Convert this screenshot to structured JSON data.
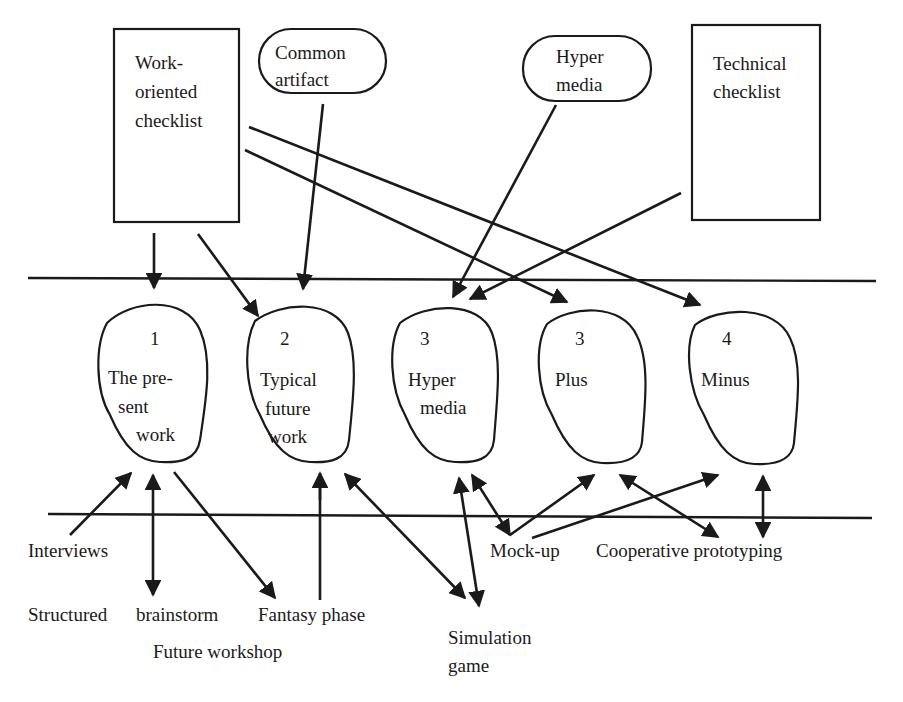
{
  "diagram": {
    "colors": {
      "ink": "#1a1a1a",
      "background": "#ffffff"
    },
    "sources": {
      "work_checklist": {
        "lines": [
          "Work-",
          "oriented",
          "checklist"
        ]
      },
      "common_artifact": {
        "lines": [
          "Common",
          "artifact"
        ]
      },
      "hyper_media": {
        "lines": [
          "Hyper",
          "media"
        ]
      },
      "technical_checklist": {
        "lines": [
          "Technical",
          "checklist"
        ]
      }
    },
    "blobs": [
      {
        "number": "1",
        "lines": [
          "The pre-",
          "sent",
          "work"
        ]
      },
      {
        "number": "2",
        "lines": [
          "Typical",
          "future",
          "work"
        ]
      },
      {
        "number": "3",
        "lines": [
          "Hyper",
          "media"
        ]
      },
      {
        "number": "3",
        "lines": [
          "Plus"
        ]
      },
      {
        "number": "4",
        "lines": [
          "Minus"
        ]
      }
    ],
    "techniques": {
      "interviews": "Interviews",
      "structured": "Structured",
      "brainstorm": "brainstorm",
      "fantasy_phase": "Fantasy phase",
      "future_workshop": "Future workshop",
      "simulation_game": [
        "Simulation",
        "game"
      ],
      "mock_up": "Mock-up",
      "cooperative_prototyping": "Cooperative prototyping"
    }
  }
}
